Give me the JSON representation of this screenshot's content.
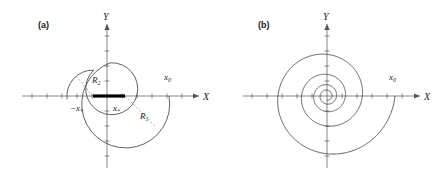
{
  "figure": {
    "background_color": "#ffffff",
    "curve_color": "#3a3a3a",
    "axis_color": "#555555",
    "panels": [
      {
        "id": "panel-a",
        "tag": "(a)",
        "description": "Two joined circular arcs forming a closed trajectory in the XY plane",
        "axes": {
          "x_label": "X",
          "y_label": "Y",
          "origin": {
            "x": 107,
            "y": 96
          },
          "x_range_px": [
            22,
            203
          ],
          "y_range_px": [
            20,
            170
          ]
        },
        "labels": [
          {
            "name": "x0",
            "text": "x",
            "sub": "0",
            "x": 168,
            "y": 79
          },
          {
            "name": "R1",
            "text": "R",
            "sub": "1",
            "x": 143,
            "y": 117
          },
          {
            "name": "R2",
            "text": "R",
            "sub": "2",
            "x": 97,
            "y": 82
          },
          {
            "name": "minus-x-star",
            "text": "−x",
            "sub": "*",
            "x": 74,
            "y": 110
          },
          {
            "name": "x-star",
            "text": "x",
            "sub": "*",
            "x": 115,
            "y": 110
          }
        ],
        "segment": {
          "name": "thick-x-segment",
          "x1": 93,
          "x2": 125,
          "y": 96
        }
      },
      {
        "id": "panel-b",
        "tag": "(b)",
        "description": "Inward clockwise spiral converging to the origin of the XY plane",
        "axes": {
          "x_label": "X",
          "y_label": "Y",
          "origin": {
            "x": 327,
            "y": 96
          },
          "x_range_px": [
            243,
            424
          ],
          "y_range_px": [
            20,
            170
          ]
        },
        "labels": [
          {
            "name": "x0",
            "text": "x",
            "sub": "0",
            "x": 393,
            "y": 79
          }
        ]
      }
    ]
  },
  "chart_data": {
    "type": "line",
    "title": "",
    "xlabel": "X",
    "ylabel": "Y",
    "panels": [
      {
        "label": "(a)",
        "kind": "piecewise-circular-arcs",
        "annotations": [
          "x₀",
          "R₁",
          "R₂",
          "−xₓ",
          "xₓ"
        ],
        "x_star": 0.42,
        "x_0": 1.35,
        "R1": 1.0,
        "R2": 0.58,
        "arc1_center": [
          0.42,
          0.0
        ],
        "arc1_radius": 1.0,
        "arc1_start_deg": 0,
        "arc1_end_deg": -250,
        "arc2_center": [
          -0.42,
          0.0
        ],
        "arc2_radius": 0.58,
        "arc2_start_deg": 175,
        "arc2_end_deg": -10,
        "segment_on_x_axis": [
          -0.42,
          0.42
        ]
      },
      {
        "label": "(b)",
        "kind": "logarithmic-spiral-inward",
        "annotations": [
          "x₀"
        ],
        "x_0": 1.35,
        "turns": 4.25,
        "decay_per_turn": 0.52,
        "direction": "clockwise",
        "converges_to": [
          0,
          0
        ]
      }
    ],
    "grid": false,
    "legend": "none"
  }
}
